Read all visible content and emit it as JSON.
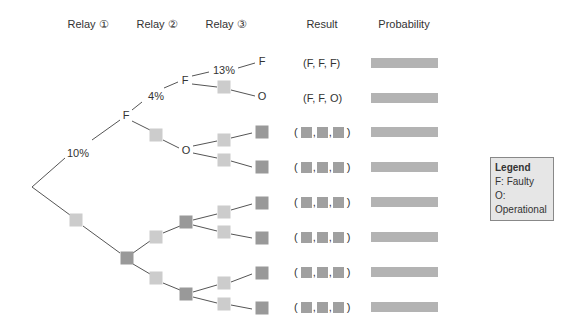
{
  "headers": {
    "relay1": "Relay ①",
    "relay2": "Relay ②",
    "relay3": "Relay ③",
    "result": "Result",
    "probability": "Probability"
  },
  "tree": {
    "root": {
      "x": 32,
      "y": 187
    },
    "level1": {
      "top": {
        "label": "F",
        "x": 126,
        "y": 115,
        "edge_label": "10%"
      },
      "bottom": {
        "type": "blank-light",
        "x": 76,
        "y": 220
      }
    },
    "level1_bottom_dark": {
      "x": 127,
      "y": 258
    },
    "level2": [
      {
        "label": "F",
        "x": 184,
        "y": 80,
        "edge_label": "4%"
      },
      {
        "type": "blank-light",
        "x": 156,
        "y": 135
      },
      {
        "label": "O",
        "x": 185,
        "y": 150
      },
      {
        "type": "blank-light",
        "x": 156,
        "y": 237
      },
      {
        "type": "blank-dark",
        "x": 186,
        "y": 222
      },
      {
        "type": "blank-light",
        "x": 156,
        "y": 278
      },
      {
        "type": "blank-dark",
        "x": 186,
        "y": 294
      }
    ],
    "level3": [
      {
        "label": "F",
        "x": 262,
        "y": 61,
        "edge_label": "13%"
      },
      {
        "type": "blank-light",
        "x": 224,
        "y": 87
      },
      {
        "label": "O",
        "x": 262,
        "y": 96
      }
    ]
  },
  "results": [
    {
      "text": "(F, F, F)",
      "y": 63
    },
    {
      "text": "(F, F, O)",
      "y": 98
    },
    {
      "text": "blank",
      "y": 132
    },
    {
      "text": "blank",
      "y": 167
    },
    {
      "text": "blank",
      "y": 202
    },
    {
      "text": "blank",
      "y": 237
    },
    {
      "text": "blank",
      "y": 272
    },
    {
      "text": "blank",
      "y": 307
    }
  ],
  "legend": {
    "title": "Legend",
    "items": [
      "F: Faulty",
      "O: Operational"
    ]
  },
  "colors": {
    "line": "#555555",
    "box_light": "#cccccc",
    "box_dark": "#999999",
    "prob_bar": "#b3b3b3",
    "legend_bg": "#e6e6e6"
  }
}
